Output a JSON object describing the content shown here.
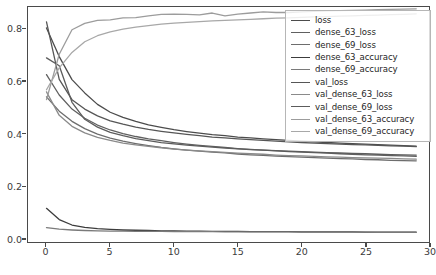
{
  "chart_data": {
    "type": "line",
    "title": "",
    "xlabel": "",
    "ylabel": "",
    "xlim": [
      -1.45,
      30.0
    ],
    "ylim": [
      -0.015,
      0.885
    ],
    "grid": false,
    "legend_position": "upper right",
    "colormap": "grayscale",
    "x": [
      0,
      1,
      2,
      3,
      4,
      5,
      6,
      7,
      8,
      9,
      10,
      11,
      12,
      13,
      14,
      15,
      16,
      17,
      18,
      19,
      20,
      21,
      22,
      23,
      24,
      25,
      26,
      27,
      28,
      29
    ],
    "xticks": [
      0,
      5,
      10,
      15,
      20,
      25,
      30
    ],
    "xtick_labels": [
      "0",
      "5",
      "10",
      "15",
      "20",
      "25",
      "30"
    ],
    "yticks": [
      0.0,
      0.2,
      0.4,
      0.6,
      0.8
    ],
    "ytick_labels": [
      "0.0",
      "0.2",
      "0.4",
      "0.6",
      "0.8"
    ],
    "series": [
      {
        "name": "loss",
        "color": "#4c4c4c",
        "width": 1.3,
        "values": [
          0.805,
          0.695,
          0.607,
          0.556,
          0.512,
          0.482,
          0.462,
          0.447,
          0.434,
          0.424,
          0.415,
          0.408,
          0.402,
          0.396,
          0.392,
          0.387,
          0.384,
          0.38,
          0.377,
          0.374,
          0.371,
          0.369,
          0.366,
          0.364,
          0.362,
          0.36,
          0.358,
          0.356,
          0.354,
          0.352
        ]
      },
      {
        "name": "dense_63_loss",
        "color": "#606060",
        "width": 1.3,
        "values": [
          0.626,
          0.548,
          0.494,
          0.459,
          0.433,
          0.414,
          0.4,
          0.389,
          0.38,
          0.373,
          0.366,
          0.36,
          0.355,
          0.351,
          0.347,
          0.343,
          0.34,
          0.337,
          0.334,
          0.331,
          0.329,
          0.327,
          0.325,
          0.323,
          0.321,
          0.319,
          0.318,
          0.316,
          0.315,
          0.313
        ]
      },
      {
        "name": "dense_69_loss",
        "color": "#6d6d6d",
        "width": 1.3,
        "values": [
          0.541,
          0.486,
          0.447,
          0.419,
          0.398,
          0.383,
          0.371,
          0.362,
          0.354,
          0.347,
          0.342,
          0.337,
          0.333,
          0.329,
          0.326,
          0.322,
          0.319,
          0.317,
          0.314,
          0.312,
          0.31,
          0.308,
          0.306,
          0.304,
          0.303,
          0.301,
          0.3,
          0.298,
          0.297,
          0.296
        ]
      },
      {
        "name": "dense_63_accuracy",
        "color": "#3c3c3c",
        "width": 1.3,
        "values": [
          0.114,
          0.071,
          0.05,
          0.041,
          0.036,
          0.033,
          0.031,
          0.03,
          0.029,
          0.028,
          0.028,
          0.027,
          0.027,
          0.026,
          0.026,
          0.026,
          0.025,
          0.025,
          0.025,
          0.025,
          0.024,
          0.024,
          0.024,
          0.024,
          0.024,
          0.023,
          0.023,
          0.023,
          0.023,
          0.023
        ]
      },
      {
        "name": "dense_69_accuracy",
        "color": "#7a7a7a",
        "width": 1.3,
        "values": [
          0.04,
          0.034,
          0.031,
          0.029,
          0.028,
          0.027,
          0.027,
          0.026,
          0.026,
          0.026,
          0.025,
          0.025,
          0.025,
          0.025,
          0.024,
          0.024,
          0.024,
          0.024,
          0.024,
          0.024,
          0.023,
          0.023,
          0.023,
          0.023,
          0.023,
          0.023,
          0.022,
          0.022,
          0.022,
          0.022
        ]
      },
      {
        "name": "val_loss",
        "color": "#565656",
        "width": 1.3,
        "values": [
          0.828,
          0.608,
          0.53,
          0.494,
          0.468,
          0.449,
          0.436,
          0.425,
          0.416,
          0.409,
          0.403,
          0.397,
          0.392,
          0.387,
          0.384,
          0.38,
          0.377,
          0.374,
          0.371,
          0.369,
          0.366,
          0.364,
          0.362,
          0.36,
          0.358,
          0.357,
          0.355,
          0.353,
          0.352,
          0.35
        ]
      },
      {
        "name": "val_dense_63_loss",
        "color": "#8a8a8a",
        "width": 1.3,
        "values": [
          0.56,
          0.47,
          0.428,
          0.403,
          0.386,
          0.374,
          0.364,
          0.357,
          0.351,
          0.346,
          0.341,
          0.337,
          0.334,
          0.331,
          0.328,
          0.325,
          0.323,
          0.321,
          0.318,
          0.316,
          0.315,
          0.313,
          0.311,
          0.31,
          0.308,
          0.307,
          0.306,
          0.305,
          0.303,
          0.302
        ]
      },
      {
        "name": "val_dense_69_loss",
        "color": "#5c5c5c",
        "width": 1.3,
        "values": [
          0.69,
          0.66,
          0.52,
          0.455,
          0.425,
          0.405,
          0.392,
          0.381,
          0.373,
          0.366,
          0.361,
          0.356,
          0.352,
          0.348,
          0.345,
          0.342,
          0.339,
          0.337,
          0.335,
          0.333,
          0.331,
          0.329,
          0.327,
          0.326,
          0.324,
          0.323,
          0.321,
          0.32,
          0.319,
          0.318
        ]
      },
      {
        "name": "val_dense_63_accuracy",
        "color": "#9c9c9c",
        "width": 1.3,
        "values": [
          0.53,
          0.704,
          0.798,
          0.822,
          0.834,
          0.836,
          0.843,
          0.844,
          0.851,
          0.857,
          0.858,
          0.857,
          0.855,
          0.862,
          0.851,
          0.858,
          0.862,
          0.866,
          0.864,
          0.864,
          0.866,
          0.868,
          0.87,
          0.871,
          0.872,
          0.873,
          0.875,
          0.876,
          0.877,
          0.878
        ]
      },
      {
        "name": "val_dense_69_accuracy",
        "color": "#a8a8a8",
        "width": 1.3,
        "values": [
          0.568,
          0.652,
          0.711,
          0.752,
          0.775,
          0.79,
          0.8,
          0.808,
          0.814,
          0.819,
          0.823,
          0.826,
          0.829,
          0.832,
          0.834,
          0.836,
          0.838,
          0.84,
          0.842,
          0.843,
          0.845,
          0.847,
          0.848,
          0.85,
          0.851,
          0.853,
          0.854,
          0.856,
          0.857,
          0.859
        ]
      }
    ]
  },
  "legend": {
    "entries": [
      {
        "label": "loss",
        "color": "#4c4c4c"
      },
      {
        "label": "dense_63_loss",
        "color": "#606060"
      },
      {
        "label": "dense_69_loss",
        "color": "#6d6d6d"
      },
      {
        "label": "dense_63_accuracy",
        "color": "#3c3c3c"
      },
      {
        "label": "dense_69_accuracy",
        "color": "#7a7a7a"
      },
      {
        "label": "val_loss",
        "color": "#565656"
      },
      {
        "label": "val_dense_63_loss",
        "color": "#8a8a8a"
      },
      {
        "label": "val_dense_69_loss",
        "color": "#5c5c5c"
      },
      {
        "label": "val_dense_63_accuracy",
        "color": "#9c9c9c"
      },
      {
        "label": "val_dense_69_accuracy",
        "color": "#a8a8a8"
      }
    ]
  },
  "figure": {
    "background": "#ffffff",
    "axes_edge_color": "#4a4a4a",
    "tick_color": "#3b3b3b"
  }
}
